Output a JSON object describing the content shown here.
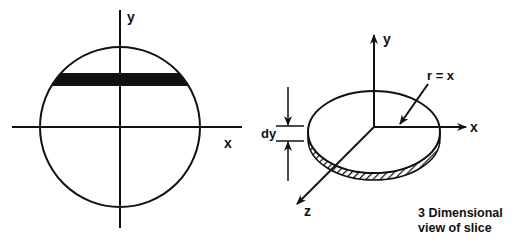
{
  "left_diagram": {
    "x_label": "x",
    "y_label": "y"
  },
  "right_diagram": {
    "x_label": "x",
    "y_label": "y",
    "z_label": "z",
    "radius_label": "r = x",
    "thickness_label": "dy",
    "caption_line1": "3 Dimensional",
    "caption_line2": "view of slice"
  }
}
